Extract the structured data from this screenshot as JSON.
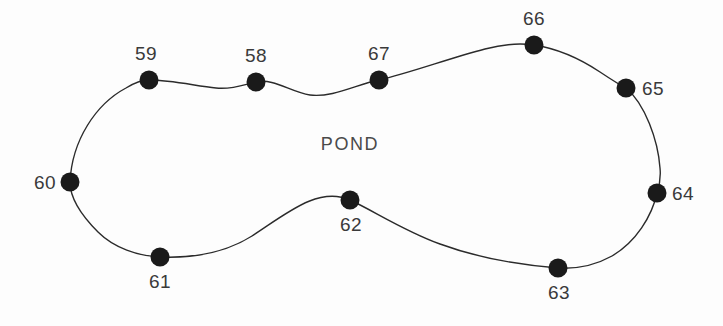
{
  "figure": {
    "title": "POND",
    "background_color": "#fdfdfd",
    "outline_color": "#2b2b2b",
    "dot_color": "#1a1a1a",
    "label_color": "#3a3a3a",
    "width": 723,
    "height": 326
  },
  "area_label": {
    "text": "POND",
    "x": 350,
    "y": 150
  },
  "chart_data": {
    "type": "scatter",
    "title": "POND",
    "xlabel": "",
    "ylabel": "",
    "xlim": [
      0,
      723
    ],
    "ylim": [
      326,
      0
    ],
    "grid": false,
    "legend": null,
    "annotations": [
      "POND"
    ],
    "categories": [
      "58",
      "59",
      "60",
      "61",
      "62",
      "63",
      "64",
      "65",
      "66",
      "67"
    ],
    "points": [
      {
        "label": "58",
        "x": 256,
        "y": 82,
        "label_x": 256,
        "label_y": 62,
        "label_anchor": "middle"
      },
      {
        "label": "59",
        "x": 149,
        "y": 80,
        "label_x": 146,
        "label_y": 60,
        "label_anchor": "middle"
      },
      {
        "label": "60",
        "x": 70,
        "y": 182,
        "label_x": 56,
        "label_y": 189,
        "label_anchor": "end"
      },
      {
        "label": "61",
        "x": 160,
        "y": 257,
        "label_x": 160,
        "label_y": 288,
        "label_anchor": "middle"
      },
      {
        "label": "62",
        "x": 350,
        "y": 200,
        "label_x": 351,
        "label_y": 231,
        "label_anchor": "middle"
      },
      {
        "label": "63",
        "x": 558,
        "y": 268,
        "label_x": 559,
        "label_y": 299,
        "label_anchor": "middle"
      },
      {
        "label": "64",
        "x": 657,
        "y": 193,
        "label_x": 672,
        "label_y": 200,
        "label_anchor": "start"
      },
      {
        "label": "65",
        "x": 626,
        "y": 88,
        "label_x": 642,
        "label_y": 95,
        "label_anchor": "start"
      },
      {
        "label": "66",
        "x": 534,
        "y": 45,
        "label_x": 534,
        "label_y": 25,
        "label_anchor": "middle"
      },
      {
        "label": "67",
        "x": 379,
        "y": 80,
        "label_x": 379,
        "label_y": 60,
        "label_anchor": "middle"
      }
    ],
    "dot_radius": 9.5,
    "traverse_order": [
      "60",
      "59",
      "58",
      "67",
      "66",
      "65",
      "64",
      "63",
      "62",
      "61",
      "60"
    ],
    "outline_path": "M 70 182 C 72 140 96 104 126 88 C 134 83 142 80 149 80 C 172 80 196 86 216 88 C 232 90 246 84 256 82 C 274 78 290 92 310 95 C 332 98 358 84 379 80 C 410 73 450 58 485 49 C 504 44 520 43 534 45 C 560 49 582 60 600 72 C 612 80 620 85 626 88 C 645 104 658 140 660 168 C 661 178 659 187 657 193 C 652 216 636 242 612 256 C 594 266 575 269 558 268 C 520 265 478 258 440 244 C 404 231 374 211 350 200 C 318 186 286 214 252 236 C 222 255 186 258 160 257 C 138 256 114 248 98 232 C 80 214 70 198 70 182 Z"
  }
}
